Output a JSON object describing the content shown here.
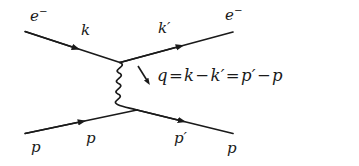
{
  "diagram": {
    "background_color": "#ffffff",
    "line_color": "#1a1a1a",
    "width": 359,
    "height": 166,
    "labels": {
      "incoming_electron_particle": "e",
      "incoming_electron_charge": "−",
      "incoming_electron_momentum": "k",
      "outgoing_electron_particle": "e",
      "outgoing_electron_charge": "−",
      "outgoing_electron_momentum": "k′",
      "incoming_proton_particle": "p",
      "incoming_proton_momentum": "p",
      "outgoing_proton_particle": "p",
      "outgoing_proton_momentum": "p′",
      "momentum_transfer_equation": "q = k − k′ = p′ − p",
      "eq_q": "q",
      "eq_eq1": "=",
      "eq_k": "k",
      "eq_minus1": "−",
      "eq_kprime": "k′",
      "eq_eq2": "=",
      "eq_pprime": "p′",
      "eq_minus2": "−",
      "eq_p": "p"
    },
    "elements": {
      "photon_propagator": "wavy-line",
      "top_vertex": "electron-photon-vertex",
      "bottom_vertex": "proton-photon-vertex",
      "q_direction_arrow": "momentum-transfer-arrow"
    }
  }
}
